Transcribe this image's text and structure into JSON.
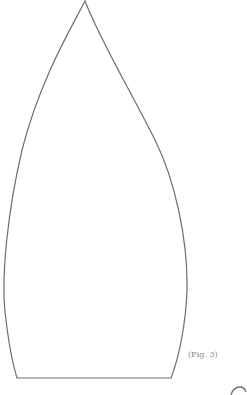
{
  "figure": {
    "caption": "(Fig. 3)",
    "stroke_color": "#6e6e6e",
    "background": "#ffffff",
    "shape": "pointed-arch-outline"
  }
}
